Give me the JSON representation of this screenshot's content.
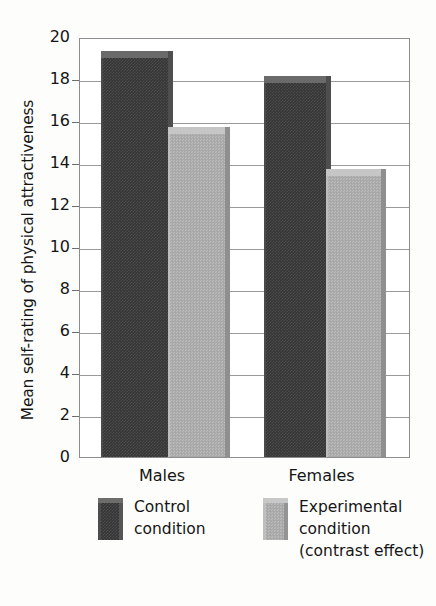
{
  "chart_data": {
    "type": "bar",
    "title": "",
    "xlabel": "",
    "ylabel": "Mean self-rating of physical attractiveness",
    "categories": [
      "Males",
      "Females"
    ],
    "series": [
      {
        "name": "Control condition",
        "values": [
          19.1,
          17.9
        ],
        "color": "#353535"
      },
      {
        "name": "Experimental condition (contrast effect)",
        "values": [
          15.5,
          13.5
        ],
        "color": "#acacac"
      }
    ],
    "ylim": [
      0,
      20
    ],
    "yticks": [
      0,
      2,
      4,
      6,
      8,
      10,
      12,
      14,
      16,
      18,
      20
    ],
    "ytick_labels": [
      "0",
      "2",
      "4",
      "6",
      "8",
      "10",
      "12",
      "14",
      "16",
      "18",
      "20"
    ],
    "grid": true,
    "grid_axis": "y",
    "legend_position": "bottom",
    "legend": [
      {
        "line1": "Control",
        "line2": "condition",
        "line3": ""
      },
      {
        "line1": "Experimental",
        "line2": "condition",
        "line3": "(contrast effect)"
      }
    ],
    "background_color": "#fdfdfc",
    "plot_background_color": "#ffffff",
    "axis_color": "#8d8d8d"
  }
}
